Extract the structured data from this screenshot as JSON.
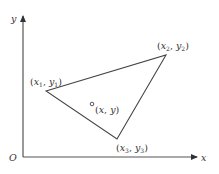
{
  "diagram": {
    "type": "coordinate-plane-triangle",
    "axes": {
      "x_label": "x",
      "y_label": "y",
      "origin_label": "O",
      "color": "#555555"
    },
    "triangle": {
      "stroke_color": "#444444",
      "vertices": [
        {
          "id": "p1",
          "label_open": "(",
          "var_x": "x",
          "sub_x": "1",
          "sep": ", ",
          "var_y": "y",
          "sub_y": "1",
          "label_close": ")"
        },
        {
          "id": "p2",
          "label_open": "(",
          "var_x": "x",
          "sub_x": "2",
          "sep": ", ",
          "var_y": "y",
          "sub_y": "2",
          "label_close": ")"
        },
        {
          "id": "p3",
          "label_open": "(",
          "var_x": "x",
          "sub_x": "3",
          "sep": ", ",
          "var_y": "y",
          "sub_y": "3",
          "label_close": ")"
        }
      ]
    },
    "interior_point": {
      "label_open": "(",
      "var_x": "x",
      "sep": ", ",
      "var_y": "y",
      "label_close": ")"
    }
  }
}
